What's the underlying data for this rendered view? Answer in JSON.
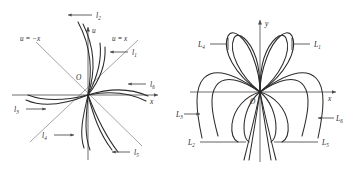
{
  "figure": {
    "background_color": "#ffffff",
    "curve_color": "#2b2b2b",
    "axis_color": "#6e6e6e",
    "guide_color": "#8d8d8d"
  },
  "left_panel": {
    "name": "phase-portrait-ux-plane",
    "origin_label": "O",
    "axes": {
      "vertical_label": "u",
      "horizontal_label": "x"
    },
    "guide_lines": [
      {
        "id": "line-u-eq-neg-x",
        "label": "u = −x"
      },
      {
        "id": "line-u-eq-x",
        "label": "u = x"
      }
    ],
    "curve_labels": [
      {
        "id": "l1",
        "base": "l",
        "sub": "1",
        "arrow": "left"
      },
      {
        "id": "l2",
        "base": "l",
        "sub": "2",
        "arrow": "left"
      },
      {
        "id": "l3",
        "base": "l",
        "sub": "3",
        "arrow": "right"
      },
      {
        "id": "l4",
        "base": "l",
        "sub": "4",
        "arrow": "right"
      },
      {
        "id": "l5",
        "base": "l",
        "sub": "5",
        "arrow": "left"
      },
      {
        "id": "l6",
        "base": "l",
        "sub": "6",
        "arrow": "left"
      }
    ]
  },
  "right_panel": {
    "name": "petal-curves-xy-plane",
    "origin_label": "O",
    "axes": {
      "vertical_label": "y",
      "horizontal_label": "x"
    },
    "curve_labels": [
      {
        "id": "L1",
        "base": "L",
        "sub": "1",
        "arrow": "left"
      },
      {
        "id": "L2",
        "base": "L",
        "sub": "2",
        "arrow": "right"
      },
      {
        "id": "L3",
        "base": "L",
        "sub": "3",
        "arrow": "right"
      },
      {
        "id": "L4",
        "base": "L",
        "sub": "4",
        "arrow": "right"
      },
      {
        "id": "L5",
        "base": "L",
        "sub": "5",
        "arrow": "left"
      },
      {
        "id": "L6",
        "base": "L",
        "sub": "6",
        "arrow": "left"
      }
    ]
  }
}
